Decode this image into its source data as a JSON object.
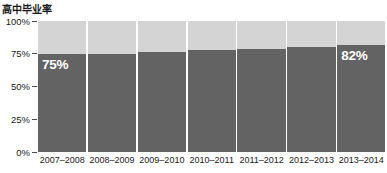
{
  "chart_data": {
    "type": "bar",
    "title": "高中毕业率",
    "xlabel": "",
    "ylabel": "",
    "ylim": [
      0,
      100
    ],
    "grid": false,
    "legend": "none",
    "stacked": true,
    "categories": [
      "2007–2008",
      "2008–2009",
      "2009–2010",
      "2010–2011",
      "2011–2012",
      "2012–2013",
      "2013–2014"
    ],
    "series": [
      {
        "name": "毕业率",
        "color": "#636363",
        "values": [
          75,
          75,
          76,
          78,
          79,
          80,
          82
        ]
      },
      {
        "name": "剩余",
        "color": "#d4d4d4",
        "values": [
          25,
          25,
          24,
          22,
          21,
          20,
          18
        ]
      }
    ],
    "y_ticks": [
      "100%",
      "75%",
      "50%",
      "25%",
      "0%"
    ],
    "y_tick_values": [
      100,
      75,
      50,
      25,
      0
    ],
    "data_labels": [
      {
        "index": 0,
        "text": "75%"
      },
      {
        "index": 6,
        "text": "82%"
      }
    ]
  },
  "colors": {
    "bar_value": "#636363",
    "bar_remainder": "#d4d4d4",
    "text": "#1a1a1a",
    "label_text": "#ffffff",
    "tick_mark": "#4a4a4a",
    "background": "#ffffff"
  }
}
